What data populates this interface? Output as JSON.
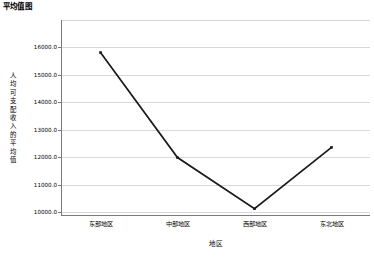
{
  "chart_data": {
    "type": "line",
    "title": "平均值图",
    "xlabel": "地区",
    "ylabel": "人均可支配收入的平均值",
    "categories": [
      "东部地区",
      "中部地区",
      "西部地区",
      "东北地区"
    ],
    "series": [
      {
        "name": "人均可支配收入的平均值",
        "values": [
          15800,
          11980,
          10120,
          12350
        ]
      }
    ],
    "ylim": [
      10000,
      16000
    ],
    "yticks": [
      10000,
      11000,
      12000,
      13000,
      14000,
      15000,
      16000
    ],
    "ytick_labels": [
      "10000.0",
      "11000.0",
      "12000.0",
      "13000.0",
      "14000.0",
      "15000.0",
      "16000.0"
    ],
    "grid": true,
    "legend": "none",
    "marker": "square",
    "line_color": "#1a1a1a",
    "grid_color": "#d9d9d9",
    "axis_color": "#7a7a7a",
    "background": "#ffffff"
  },
  "chart": {
    "title": "平均值图",
    "x_axis_title": "地区",
    "y_axis_title": "人均可支配收入的平均值"
  }
}
